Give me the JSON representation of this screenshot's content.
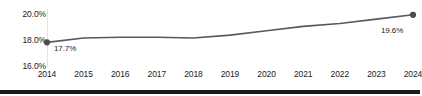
{
  "chart_data": {
    "type": "line",
    "title": "",
    "subtitle": "",
    "xlabel": "",
    "ylabel": "",
    "categories": [
      "2014",
      "2015",
      "2016",
      "2017",
      "2018",
      "2019",
      "2020",
      "2021",
      "2022",
      "2023",
      "2024"
    ],
    "x": [
      2014,
      2015,
      2016,
      2017,
      2018,
      2019,
      2020,
      2021,
      2022,
      2023,
      2024
    ],
    "values": [
      17.7,
      18.0,
      18.05,
      18.05,
      18.0,
      18.2,
      18.5,
      18.8,
      19.0,
      19.3,
      19.6
    ],
    "ylim": [
      16.0,
      20.0
    ],
    "yticks": [
      16.0,
      18.0,
      20.0
    ],
    "ytick_labels": [
      "16.0%",
      "18.0%",
      "20.0%"
    ],
    "grid": false,
    "legend": "none",
    "series": [
      {
        "name": "",
        "values": [
          17.7,
          18.0,
          18.05,
          18.05,
          18.0,
          18.2,
          18.5,
          18.8,
          19.0,
          19.3,
          19.6
        ],
        "color": "#595959"
      }
    ],
    "annotations": [
      {
        "id": "start",
        "x": 2014,
        "y": 17.7,
        "text": "17.7%"
      },
      {
        "id": "end",
        "x": 2024,
        "y": 19.6,
        "text": "19.6%"
      }
    ],
    "markers": [
      {
        "x": 2014,
        "y": 17.7
      },
      {
        "x": 2024,
        "y": 19.6
      }
    ]
  },
  "colors": {
    "line": "#595959",
    "marker": "#4d4d4d",
    "axis": "#e3e3e3",
    "text": "#1a1a1a",
    "bottom_bar": "#1c1c1c",
    "background": "#ffffff"
  }
}
